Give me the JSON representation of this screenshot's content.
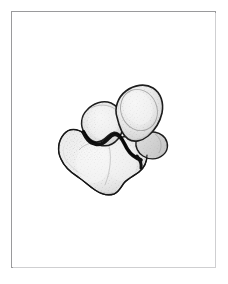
{
  "page": {
    "background_color": "#ffffff",
    "width": 228,
    "height": 284
  },
  "plate": {
    "name": "illustration-plate",
    "border_color": "#9a9a9c",
    "background_color": "#ffffff",
    "caption": "",
    "label": "",
    "text_content_present": false
  },
  "figure": {
    "title": "",
    "caption": "",
    "view": "oblique",
    "medium": "pencil stipple and ink outline drawing",
    "icon_names": [
      "bone-illustration",
      "stipple-texture",
      "contour-outline"
    ],
    "colors": {
      "outline": "#1c1c1c",
      "ridge_line": "#111111",
      "fill_light": "#f2f2f2",
      "fill_mid": "#e4e4e4",
      "fill_shadow": "#cfcfcf",
      "stipple": "#8d8d8d",
      "inner_facet_line": "#9b9b9b"
    },
    "parts": [
      {
        "name": "superior-lobe-right",
        "label": ""
      },
      {
        "name": "superior-lobe-left",
        "label": ""
      },
      {
        "name": "inferior-body",
        "label": ""
      },
      {
        "name": "dark-sulcus-ridge",
        "label": ""
      },
      {
        "name": "articular-facet-outline",
        "label": ""
      }
    ]
  }
}
